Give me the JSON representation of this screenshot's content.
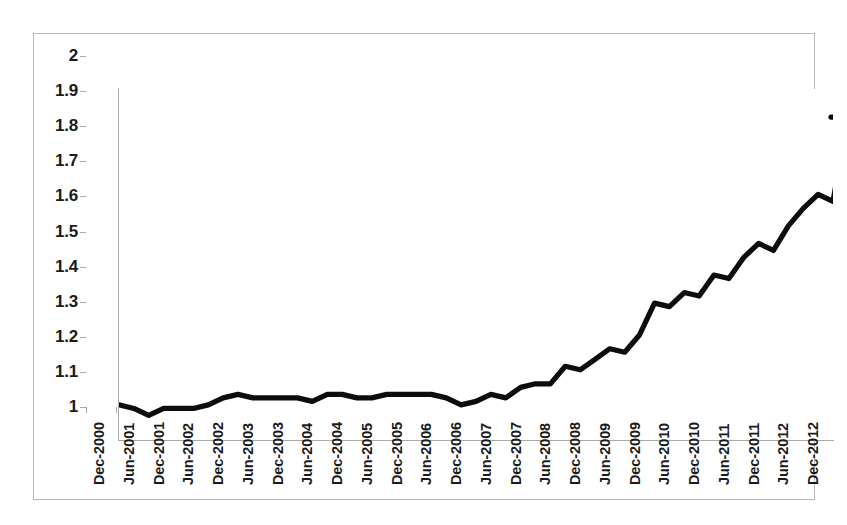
{
  "chart_data": {
    "type": "line",
    "title": "",
    "subtitle": "",
    "xlabel": "",
    "ylabel": "",
    "ylim": [
      1,
      2
    ],
    "ytick_step": 0.1,
    "grid": false,
    "legend": "none",
    "line_color": "#0d0d0d",
    "background_color": "#ffffff",
    "border_color": "#b9b9b9",
    "axis_color": "#aaaaaa",
    "frequency": "quarterly",
    "x_tick_labels": [
      "Dec-2000",
      "Jun-2001",
      "Dec-2001",
      "Jun-2002",
      "Dec-2002",
      "Jun-2003",
      "Dec-2003",
      "Jun-2004",
      "Dec-2004",
      "Jun-2005",
      "Dec-2005",
      "Jun-2006",
      "Dec-2006",
      "Jun-2007",
      "Dec-2007",
      "Jun-2008",
      "Dec-2008",
      "Jun-2009",
      "Dec-2009",
      "Jun-2010",
      "Dec-2010",
      "Jun-2011",
      "Dec-2011",
      "Jun-2012",
      "Dec-2012"
    ],
    "y_tick_labels": [
      "2",
      "1.9",
      "1.8",
      "1.7",
      "1.6",
      "1.5",
      "1.4",
      "1.3",
      "1.2",
      "1.1",
      "1"
    ],
    "y_tick_values": [
      2,
      1.9,
      1.8,
      1.7,
      1.6,
      1.5,
      1.4,
      1.3,
      1.2,
      1.1,
      1
    ],
    "series": [
      {
        "name": "value",
        "x": [
          "Dec-2000",
          "Mar-2001",
          "Jun-2001",
          "Sep-2001",
          "Dec-2001",
          "Mar-2002",
          "Jun-2002",
          "Sep-2002",
          "Dec-2002",
          "Mar-2003",
          "Jun-2003",
          "Sep-2003",
          "Dec-2003",
          "Mar-2004",
          "Jun-2004",
          "Sep-2004",
          "Dec-2004",
          "Mar-2005",
          "Jun-2005",
          "Sep-2005",
          "Dec-2005",
          "Mar-2006",
          "Jun-2006",
          "Sep-2006",
          "Dec-2006",
          "Mar-2007",
          "Jun-2007",
          "Sep-2007",
          "Dec-2007",
          "Mar-2008",
          "Jun-2008",
          "Sep-2008",
          "Dec-2008",
          "Mar-2009",
          "Jun-2009",
          "Sep-2009",
          "Dec-2009",
          "Mar-2010",
          "Jun-2010",
          "Sep-2010",
          "Dec-2010",
          "Mar-2011",
          "Jun-2011",
          "Sep-2011",
          "Dec-2011",
          "Mar-2012",
          "Jun-2012",
          "Sep-2012",
          "Dec-2012"
        ],
        "values": [
          1.1,
          1.09,
          1.07,
          1.09,
          1.09,
          1.09,
          1.1,
          1.12,
          1.13,
          1.12,
          1.12,
          1.12,
          1.12,
          1.11,
          1.13,
          1.13,
          1.12,
          1.12,
          1.13,
          1.13,
          1.13,
          1.13,
          1.12,
          1.1,
          1.11,
          1.13,
          1.12,
          1.15,
          1.16,
          1.16,
          1.21,
          1.2,
          1.23,
          1.26,
          1.25,
          1.3,
          1.39,
          1.38,
          1.42,
          1.41,
          1.47,
          1.46,
          1.52,
          1.56,
          1.54,
          1.61,
          1.66,
          1.7,
          1.68
        ]
      }
    ],
    "annotations": [
      {
        "text": "final value ~1.92",
        "x": "Dec-2012",
        "y": 1.92
      }
    ],
    "final_plateau": {
      "from": "Sep-2012",
      "value": 1.92
    }
  }
}
